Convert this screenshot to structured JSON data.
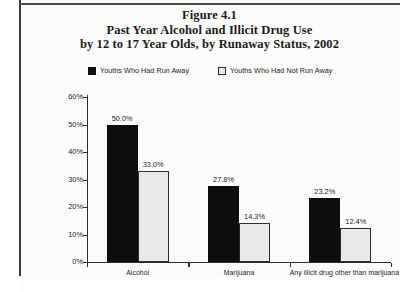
{
  "figure": {
    "label": "Figure 4.1",
    "title_line_1": "Past Year Alcohol and Illicit Drug Use",
    "title_line_2": "by 12 to 17 Year Olds, by Runaway Status, 2002"
  },
  "colors": {
    "series_runaway": "#0d0d0d",
    "series_not_runaway": "#e9e9e9",
    "axis": "#2e2e2c",
    "text": "#1d1d1b",
    "page_background": "#fbfbfa"
  },
  "chart_data": {
    "type": "bar",
    "title": "Past Year Alcohol and Illicit Drug Use by 12 to 17 Year Olds, by Runaway Status, 2002",
    "xlabel": "",
    "ylabel": "",
    "ylim": [
      0,
      60
    ],
    "ytick_labels": [
      "60%",
      "50%",
      "40%",
      "30%",
      "20%",
      "10%",
      "0%"
    ],
    "ytick_values": [
      60,
      50,
      40,
      30,
      20,
      10,
      0
    ],
    "grid": false,
    "legend_position": "top",
    "categories": [
      "Alcohol",
      "Marijuana",
      "Any illicit drug other than marijuana"
    ],
    "series": [
      {
        "name": "Youths Who Had Run Away",
        "values": [
          50.0,
          27.8,
          23.2
        ],
        "labels": [
          "50.0%",
          "27.8%",
          "23.2%"
        ]
      },
      {
        "name": "Youths Who Had Not Run Away",
        "values": [
          33.0,
          14.3,
          12.4
        ],
        "labels": [
          "33.0%",
          "14.3%",
          "12.4%"
        ]
      }
    ]
  }
}
